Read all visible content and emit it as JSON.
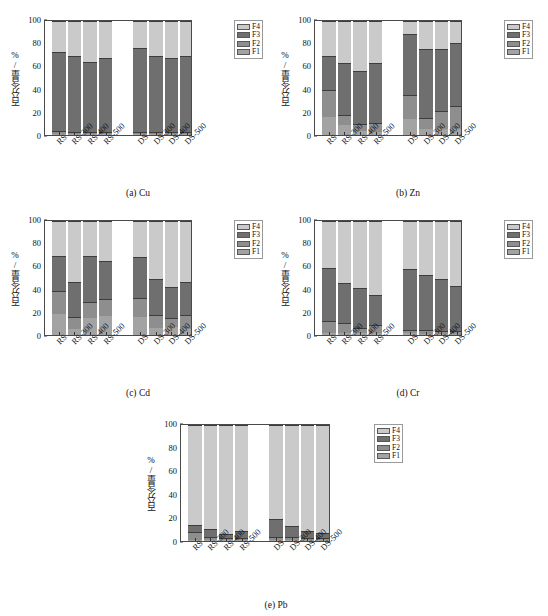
{
  "figure": {
    "ylabel": "百分含量/%",
    "categories": [
      "RS",
      "RS-300",
      "RS-400",
      "RS-500",
      "DS",
      "DS-300",
      "DS-400",
      "DS-500"
    ],
    "yticks": [
      0,
      20,
      40,
      60,
      80,
      100
    ],
    "ylim": [
      0,
      100
    ],
    "legend": [
      "F4",
      "F3",
      "F2",
      "F1"
    ],
    "colors": {
      "F1": "#a3a3a3",
      "F2": "#8e8e8e",
      "F3": "#6f6f6f",
      "F4": "#cacaca"
    },
    "captions": {
      "a": "(a) Cu",
      "b": "(b) Zn",
      "c": "(c) Cd",
      "d": "(d) Cr",
      "e": "(e) Pb"
    }
  },
  "chart_data": [
    {
      "id": "a",
      "type": "bar",
      "title": "(a) Cu",
      "stacked": true,
      "xlabel": "",
      "ylabel": "百分含量/%",
      "ylim": [
        0,
        100
      ],
      "yticks": [
        0,
        20,
        40,
        60,
        80,
        100
      ],
      "grid": false,
      "legend_position": "right",
      "categories": [
        "RS",
        "RS-300",
        "RS-400",
        "RS-500",
        "DS",
        "DS-300",
        "DS-400",
        "DS-500"
      ],
      "series": [
        {
          "name": "F1",
          "values": [
            1.0,
            0.8,
            0.6,
            0.8,
            0.8,
            0.6,
            0.6,
            0.6
          ]
        },
        {
          "name": "F2",
          "values": [
            1.5,
            1.0,
            0.8,
            1.2,
            1.0,
            0.8,
            0.8,
            0.8
          ]
        },
        {
          "name": "F3",
          "values": [
            70.5,
            67.5,
            62.6,
            66.0,
            75.2,
            68.0,
            66.0,
            68.0
          ]
        },
        {
          "name": "F4",
          "values": [
            27.0,
            30.7,
            36.0,
            32.0,
            23.0,
            30.6,
            32.6,
            30.6
          ]
        }
      ]
    },
    {
      "id": "b",
      "type": "bar",
      "title": "(b) Zn",
      "stacked": true,
      "xlabel": "",
      "ylabel": "百分含量/%",
      "ylim": [
        0,
        100
      ],
      "yticks": [
        0,
        20,
        40,
        60,
        80,
        100
      ],
      "grid": false,
      "legend_position": "right",
      "categories": [
        "RS",
        "RS-300",
        "RS-400",
        "RS-500",
        "DS",
        "DS-300",
        "DS-400",
        "DS-500"
      ],
      "series": [
        {
          "name": "F1",
          "values": [
            16.0,
            9.0,
            4.0,
            3.0,
            14.0,
            5.0,
            5.0,
            5.0
          ]
        },
        {
          "name": "F2",
          "values": [
            23.5,
            8.0,
            5.0,
            6.5,
            21.5,
            9.0,
            16.0,
            20.0
          ]
        },
        {
          "name": "F3",
          "values": [
            29.5,
            46.0,
            47.0,
            54.0,
            53.5,
            62.0,
            55.0,
            56.0
          ]
        },
        {
          "name": "F4",
          "values": [
            31.0,
            37.0,
            44.0,
            36.5,
            11.0,
            24.0,
            24.0,
            19.0
          ]
        }
      ]
    },
    {
      "id": "c",
      "type": "bar",
      "title": "(c) Cd",
      "stacked": true,
      "xlabel": "",
      "ylabel": "百分含量/%",
      "ylim": [
        0,
        100
      ],
      "yticks": [
        0,
        20,
        40,
        60,
        80,
        100
      ],
      "grid": false,
      "legend_position": "right",
      "categories": [
        "RS",
        "RS-300",
        "RS-400",
        "RS-500",
        "DS",
        "DS-300",
        "DS-400",
        "DS-500"
      ],
      "series": [
        {
          "name": "F1",
          "values": [
            19.0,
            5.5,
            15.0,
            17.0,
            16.5,
            6.5,
            7.0,
            5.0
          ]
        },
        {
          "name": "F2",
          "values": [
            19.5,
            9.5,
            13.5,
            14.5,
            15.5,
            10.5,
            7.0,
            12.5
          ]
        },
        {
          "name": "F3",
          "values": [
            30.5,
            31.0,
            40.5,
            33.0,
            36.5,
            31.5,
            27.5,
            28.5
          ]
        },
        {
          "name": "F4",
          "values": [
            31.0,
            54.0,
            31.0,
            35.5,
            31.5,
            51.5,
            58.5,
            54.0
          ]
        }
      ]
    },
    {
      "id": "d",
      "type": "bar",
      "title": "(d) Cr",
      "stacked": true,
      "xlabel": "",
      "ylabel": "百分含量/%",
      "ylim": [
        0,
        100
      ],
      "yticks": [
        0,
        20,
        40,
        60,
        80,
        100
      ],
      "grid": false,
      "legend_position": "right",
      "categories": [
        "RS",
        "RS-300",
        "RS-400",
        "RS-500",
        "DS",
        "DS-300",
        "DS-400",
        "DS-500"
      ],
      "series": [
        {
          "name": "F1",
          "values": [
            2.0,
            1.5,
            1.5,
            1.5,
            1.5,
            1.0,
            1.0,
            1.0
          ]
        },
        {
          "name": "F2",
          "values": [
            10.0,
            8.5,
            3.5,
            7.0,
            2.0,
            2.5,
            1.5,
            1.5
          ]
        },
        {
          "name": "F3",
          "values": [
            47.0,
            35.5,
            35.5,
            25.5,
            54.0,
            49.0,
            46.0,
            40.0
          ]
        },
        {
          "name": "F4",
          "values": [
            41.0,
            54.5,
            59.5,
            66.0,
            42.5,
            47.5,
            51.5,
            57.5
          ]
        }
      ]
    },
    {
      "id": "e",
      "type": "bar",
      "title": "(e) Pb",
      "stacked": true,
      "xlabel": "",
      "ylabel": "百分含量/%",
      "ylim": [
        0,
        100
      ],
      "yticks": [
        0,
        20,
        40,
        60,
        80,
        100
      ],
      "grid": false,
      "legend_position": "right",
      "categories": [
        "RS",
        "RS-300",
        "RS-400",
        "RS-500",
        "DS",
        "DS-300",
        "DS-400",
        "DS-500"
      ],
      "series": [
        {
          "name": "F1",
          "values": [
            1.0,
            1.0,
            0.8,
            0.8,
            1.0,
            0.8,
            0.8,
            0.8
          ]
        },
        {
          "name": "F2",
          "values": [
            6.0,
            2.0,
            0.7,
            1.0,
            2.0,
            1.5,
            0.7,
            0.7
          ]
        },
        {
          "name": "F3",
          "values": [
            5.5,
            6.0,
            3.0,
            5.7,
            15.0,
            9.0,
            5.8,
            4.0
          ]
        },
        {
          "name": "F4",
          "values": [
            87.5,
            91.0,
            95.5,
            92.5,
            82.0,
            88.7,
            92.7,
            94.5
          ]
        }
      ]
    }
  ]
}
